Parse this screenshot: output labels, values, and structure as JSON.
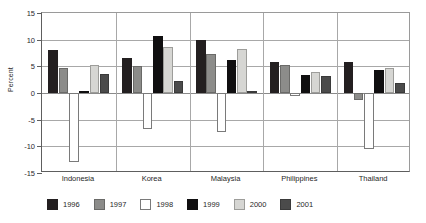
{
  "chart_data": {
    "type": "bar",
    "title": "",
    "xlabel": "",
    "ylabel": "Percent",
    "ylim": [
      -15,
      15
    ],
    "yticks": [
      15,
      10,
      5,
      0,
      -5,
      -10,
      -15
    ],
    "ytick_labels": [
      "15",
      "10",
      "5",
      "0",
      "-5",
      "-10",
      "-15"
    ],
    "grid": true,
    "legend_position": "bottom",
    "categories": [
      "Indonesia",
      "Korea",
      "Malaysia",
      "Philippines",
      "Thailand"
    ],
    "series": [
      {
        "name": "1996",
        "color": "#231f20",
        "values": [
          8.0,
          6.6,
          10.0,
          5.8,
          5.9
        ]
      },
      {
        "name": "1997",
        "color": "#8c8c8a",
        "values": [
          4.6,
          5.0,
          7.3,
          5.2,
          -1.4
        ]
      },
      {
        "name": "1998",
        "color": "#ffffff",
        "values": [
          -13.0,
          -6.7,
          -7.4,
          -0.6,
          -10.5
        ]
      },
      {
        "name": "1999",
        "color": "#100f10",
        "values": [
          0.3,
          10.7,
          6.1,
          3.4,
          4.4
        ]
      },
      {
        "name": "2000",
        "color": "#d6d6d3",
        "values": [
          5.2,
          8.6,
          8.3,
          4.0,
          4.6
        ]
      },
      {
        "name": "2001",
        "color": "#4b4b4b",
        "values": [
          3.5,
          2.3,
          0.4,
          3.2,
          1.8
        ]
      }
    ]
  },
  "legend": {
    "items": [
      {
        "label": "1996"
      },
      {
        "label": "1997"
      },
      {
        "label": "1998"
      },
      {
        "label": "1999"
      },
      {
        "label": "2000"
      },
      {
        "label": "2001"
      }
    ]
  }
}
